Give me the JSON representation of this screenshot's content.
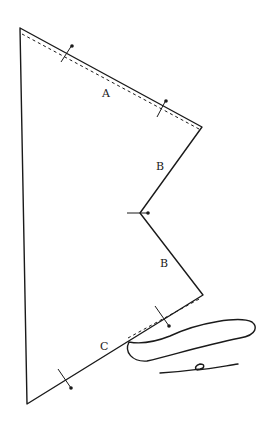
{
  "diagram": {
    "type": "sewing-pattern-piece",
    "colors": {
      "line": "#1a1a1a",
      "background": "#ffffff"
    },
    "labels": {
      "edge_a": "A",
      "edge_b_upper": "B",
      "edge_b_lower": "B",
      "edge_c": "C"
    },
    "outline_points": [
      [
        20,
        28
      ],
      [
        202,
        127
      ],
      [
        140,
        213
      ],
      [
        203,
        295
      ],
      [
        27,
        404
      ]
    ],
    "seam_lines": [
      "A",
      "C (upper portion)"
    ],
    "pin_marks": 5,
    "hand": "pointing hand pressing along edge C"
  }
}
